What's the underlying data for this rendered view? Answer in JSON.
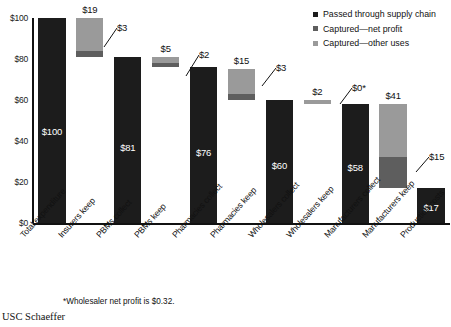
{
  "chart_data": {
    "type": "bar",
    "chart_style": "waterfall",
    "title": "",
    "subtitle": "",
    "xlabel": "",
    "ylabel": "",
    "ylim": [
      0,
      100
    ],
    "ytick_labels": [
      "$0",
      "$20",
      "$40",
      "$60",
      "$80",
      "$100"
    ],
    "ytick_values": [
      0,
      20,
      40,
      60,
      80,
      100
    ],
    "grid": false,
    "legend_position": "top-right",
    "categories": [
      "Total expenditure",
      "Insurers keep",
      "PBMs collect",
      "PBMs keep",
      "Pharmacies collect",
      "Pharmacies keep",
      "Wholesalers collect",
      "Wholesalers keep",
      "Manufacturers collect",
      "Manufacturers keep",
      "Production costs"
    ],
    "series": [
      {
        "name": "Passed through supply chain",
        "color": "#1c1c1c",
        "values": [
          100,
          0,
          81,
          0,
          76,
          0,
          60,
          0,
          58,
          0,
          17
        ]
      },
      {
        "name": "Captured—net profit",
        "color": "#5e5e5e",
        "values": [
          0,
          3,
          0,
          2,
          0,
          3,
          0,
          0,
          0,
          15,
          0
        ]
      },
      {
        "name": "Captured—other uses",
        "color": "#9a9a9a",
        "values": [
          0,
          16,
          0,
          3,
          0,
          12,
          0,
          2,
          0,
          26,
          0
        ]
      }
    ],
    "bars": [
      {
        "category": "Total expenditure",
        "total": 100,
        "base": 0,
        "passed": 100,
        "net_profit": 0,
        "other_uses": 0,
        "top_label": "",
        "inside_label": "$100"
      },
      {
        "category": "Insurers keep",
        "total": 19,
        "base": 81,
        "passed": 0,
        "net_profit": 3,
        "other_uses": 16,
        "top_label": "$19",
        "inside_label": "",
        "callout": "$3"
      },
      {
        "category": "PBMs collect",
        "total": 81,
        "base": 0,
        "passed": 81,
        "net_profit": 0,
        "other_uses": 0,
        "top_label": "",
        "inside_label": "$81"
      },
      {
        "category": "PBMs keep",
        "total": 5,
        "base": 76,
        "passed": 0,
        "net_profit": 2,
        "other_uses": 3,
        "top_label": "$5",
        "inside_label": "",
        "callout": "$2"
      },
      {
        "category": "Pharmacies collect",
        "total": 76,
        "base": 0,
        "passed": 76,
        "net_profit": 0,
        "other_uses": 0,
        "top_label": "",
        "inside_label": "$76"
      },
      {
        "category": "Pharmacies keep",
        "total": 15,
        "base": 60,
        "passed": 0,
        "net_profit": 3,
        "other_uses": 12,
        "top_label": "$15",
        "inside_label": "",
        "callout": "$3"
      },
      {
        "category": "Wholesalers collect",
        "total": 60,
        "base": 0,
        "passed": 60,
        "net_profit": 0,
        "other_uses": 0,
        "top_label": "",
        "inside_label": "$60"
      },
      {
        "category": "Wholesalers keep",
        "total": 2,
        "base": 58,
        "passed": 0,
        "net_profit": 0,
        "other_uses": 2,
        "top_label": "$2",
        "inside_label": "",
        "callout": "$0*"
      },
      {
        "category": "Manufacturers collect",
        "total": 58,
        "base": 0,
        "passed": 58,
        "net_profit": 0,
        "other_uses": 0,
        "top_label": "",
        "inside_label": "$58"
      },
      {
        "category": "Manufacturers keep",
        "total": 41,
        "base": 17,
        "passed": 0,
        "net_profit": 15,
        "other_uses": 26,
        "top_label": "$41",
        "inside_label": "",
        "callout": "$15"
      },
      {
        "category": "Production costs",
        "total": 17,
        "base": 0,
        "passed": 17,
        "net_profit": 0,
        "other_uses": 0,
        "top_label": "",
        "inside_label": "$17"
      }
    ],
    "annotations": [
      "*Wholesaler net profit is $0.32."
    ]
  },
  "axis": {
    "y_ticks": [
      "$100",
      "$80",
      "$60",
      "$40",
      "$20",
      "$0"
    ]
  },
  "labels": {
    "inside": {
      "total_expenditure": "$100",
      "pbms_collect": "$81",
      "pharmacies_collect": "$76",
      "wholesalers_collect": "$60",
      "manufacturers_collect": "$58",
      "production_costs": "$17"
    },
    "top": {
      "insurers_keep": "$19",
      "pbms_keep": "$5",
      "pharmacies_keep": "$15",
      "wholesalers_keep": "$2",
      "manufacturers_keep": "$41"
    },
    "callouts": {
      "insurers_keep": "$3",
      "pbms_keep": "$2",
      "pharmacies_keep": "$3",
      "wholesalers_keep": "$0*",
      "manufacturers_keep": "$15"
    },
    "x": [
      "Total expenditure",
      "Insurers keep",
      "PBMs collect",
      "PBMs keep",
      "Pharmacies collect",
      "Pharmacies keep",
      "Wholesalers collect",
      "Wholesalers keep",
      "Manufacturers collect",
      "Manufacturers keep",
      "Production costs"
    ]
  },
  "legend": {
    "items": [
      {
        "label": "Passed through supply chain",
        "color": "#1c1c1c"
      },
      {
        "label": "Captured—net profit",
        "color": "#5e5e5e"
      },
      {
        "label": "Captured—other uses",
        "color": "#9a9a9a"
      }
    ]
  },
  "footnote": "*Wholesaler net profit is $0.32.",
  "brand": "USC Schaeffer"
}
